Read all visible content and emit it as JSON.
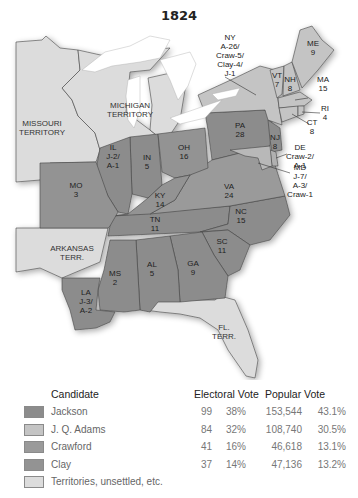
{
  "title": "1824",
  "colors": {
    "jackson": "#8c8c8c",
    "adams": "#c4c4c4",
    "crawford": "#9a9a9a",
    "clay": "#939393",
    "territory": "#dcdcdc",
    "water": "#ffffff"
  },
  "map": {
    "territories": [
      {
        "name": "MISSOURI",
        "line2": "TERRITORY"
      },
      {
        "name": "MICHIGAN",
        "line2": "TERRITORY"
      },
      {
        "name": "ARKANSAS",
        "line2": "TERR."
      },
      {
        "name": "FL.",
        "line2": "TERR."
      }
    ],
    "states": [
      {
        "abbr": "ME",
        "votes": "9"
      },
      {
        "abbr": "NY",
        "votes": "A-26/",
        "extra": [
          "Craw-5/",
          "Clay-4/",
          "J-1"
        ]
      },
      {
        "abbr": "VT",
        "votes": "7"
      },
      {
        "abbr": "NH",
        "votes": "8"
      },
      {
        "abbr": "MA",
        "votes": "15"
      },
      {
        "abbr": "RI",
        "votes": "4"
      },
      {
        "abbr": "CT",
        "votes": "8"
      },
      {
        "abbr": "NJ",
        "votes": "8"
      },
      {
        "abbr": "DE",
        "votes": "Craw-2/",
        "extra": [
          "A-1"
        ]
      },
      {
        "abbr": "MD",
        "votes": "J-7/",
        "extra": [
          "A-3/",
          "Craw-1"
        ]
      },
      {
        "abbr": "PA",
        "votes": "28"
      },
      {
        "abbr": "OH",
        "votes": "16"
      },
      {
        "abbr": "IN",
        "votes": "5"
      },
      {
        "abbr": "IL",
        "votes": "J-2/",
        "extra": [
          "A-1"
        ]
      },
      {
        "abbr": "MO",
        "votes": "3"
      },
      {
        "abbr": "KY",
        "votes": "14"
      },
      {
        "abbr": "VA",
        "votes": "24"
      },
      {
        "abbr": "TN",
        "votes": "11"
      },
      {
        "abbr": "NC",
        "votes": "15"
      },
      {
        "abbr": "SC",
        "votes": "11"
      },
      {
        "abbr": "GA",
        "votes": "9"
      },
      {
        "abbr": "AL",
        "votes": "5"
      },
      {
        "abbr": "MS",
        "votes": "2"
      },
      {
        "abbr": "LA",
        "votes": "J-3/",
        "extra": [
          "A-2"
        ]
      }
    ]
  },
  "legend": {
    "headers": {
      "candidate": "Candidate",
      "electoral": "Electoral Vote",
      "popular": "Popular Vote"
    },
    "rows": [
      {
        "name": "Jackson",
        "electoral": "99",
        "electoral_pct": "38%",
        "popular": "153,544",
        "popular_pct": "43.1%"
      },
      {
        "name": "J. Q. Adams",
        "electoral": "84",
        "electoral_pct": "32%",
        "popular": "108,740",
        "popular_pct": "30.5%"
      },
      {
        "name": "Crawford",
        "electoral": "41",
        "electoral_pct": "16%",
        "popular": "46,618",
        "popular_pct": "13.1%"
      },
      {
        "name": "Clay",
        "electoral": "37",
        "electoral_pct": "14%",
        "popular": "47,136",
        "popular_pct": "13.2%"
      },
      {
        "name": "Territories, unsettled, etc.",
        "electoral": "",
        "electoral_pct": "",
        "popular": "",
        "popular_pct": ""
      }
    ]
  }
}
